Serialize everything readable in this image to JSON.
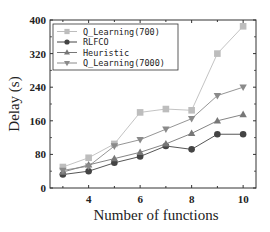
{
  "chart_data": {
    "type": "line",
    "title": "",
    "xlabel": "Number of functions",
    "ylabel": "Delay (s)",
    "x": [
      3,
      4,
      5,
      6,
      7,
      8,
      9,
      10
    ],
    "xticks": [
      4,
      6,
      8,
      10
    ],
    "yticks": [
      0,
      80,
      160,
      240,
      320,
      400
    ],
    "xlim": [
      2.5,
      10.5
    ],
    "ylim": [
      0,
      400
    ],
    "grid": false,
    "legend_position": "upper left",
    "series": [
      {
        "name": "Q_Learning(700)",
        "marker": "square",
        "color": "#bdbdbd",
        "values": [
          50,
          72,
          105,
          180,
          188,
          185,
          320,
          385
        ]
      },
      {
        "name": "RLFCO",
        "marker": "circle",
        "color": "#444444",
        "values": [
          32,
          40,
          60,
          75,
          100,
          92,
          128,
          128
        ]
      },
      {
        "name": "Heuristic",
        "marker": "triangle-up",
        "color": "#777777",
        "values": [
          38,
          55,
          70,
          85,
          105,
          130,
          160,
          175
        ]
      },
      {
        "name": "Q_Learning(7000)",
        "marker": "triangle-down",
        "color": "#8a8a8a",
        "values": [
          42,
          52,
          100,
          115,
          140,
          165,
          220,
          240
        ]
      }
    ]
  }
}
